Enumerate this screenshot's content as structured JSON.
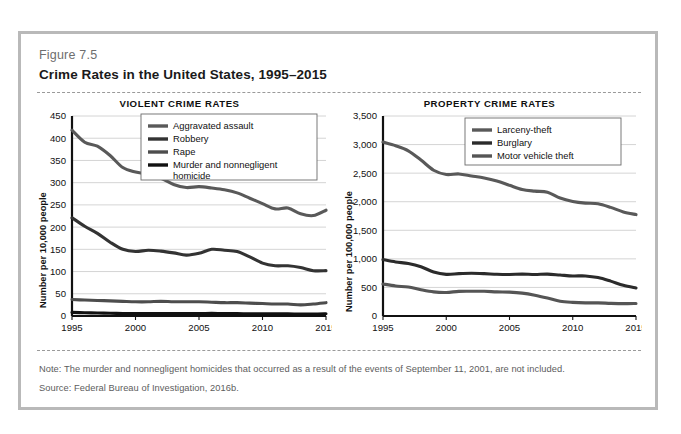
{
  "figure": {
    "number": "Figure 7.5",
    "title": "Crime Rates in the United States, 1995–2015",
    "note": "Note: The murder and nonnegligent homicides that occurred as a result of the events of September 11, 2001, are not included.",
    "source": "Source: Federal Bureau of Investigation, 2016b.",
    "border_color": "#b9b9b9"
  },
  "chart_data": [
    {
      "type": "line",
      "title": "VIOLENT CRIME RATES",
      "xlabel": "",
      "ylabel": "Number per 10,000 people",
      "xlim": [
        1995,
        2015
      ],
      "ylim": [
        0,
        450
      ],
      "yticks": [
        0,
        50,
        100,
        150,
        200,
        250,
        300,
        350,
        400,
        450
      ],
      "ytick_labels": [
        "0",
        "50",
        "100",
        "150",
        "200",
        "250",
        "300",
        "350",
        "400",
        "450"
      ],
      "xticks": [
        1995,
        2000,
        2005,
        2010,
        2015
      ],
      "xtick_labels": [
        "1995",
        "2000",
        "2005",
        "2010",
        "2015"
      ],
      "grid": true,
      "legend_position": "upper-right",
      "x": [
        1995,
        1996,
        1997,
        1998,
        1999,
        2000,
        2001,
        2002,
        2003,
        2004,
        2005,
        2006,
        2007,
        2008,
        2009,
        2010,
        2011,
        2012,
        2013,
        2014,
        2015
      ],
      "series": [
        {
          "name": "Aggravated assault",
          "color": "#595959",
          "values": [
            418,
            391,
            382,
            361,
            334,
            324,
            319,
            310,
            296,
            289,
            291,
            288,
            284,
            277,
            265,
            253,
            241,
            243,
            230,
            226,
            238
          ]
        },
        {
          "name": "Robbery",
          "color": "#333333",
          "values": [
            221,
            202,
            186,
            166,
            150,
            145,
            148,
            146,
            142,
            137,
            141,
            150,
            148,
            145,
            133,
            119,
            113,
            113,
            109,
            102,
            102
          ]
        },
        {
          "name": "Rape",
          "color": "#4d4d4d",
          "values": [
            37,
            36,
            35,
            34,
            33,
            32,
            32,
            33,
            32,
            32,
            32,
            31,
            30,
            30,
            29,
            28,
            27,
            27,
            25,
            27,
            30
          ]
        },
        {
          "name": "Murder and nonnegligent homicide",
          "color": "#111111",
          "values": [
            8.2,
            7.4,
            6.8,
            6.3,
            5.7,
            5.5,
            5.6,
            5.6,
            5.7,
            5.5,
            5.6,
            5.8,
            5.7,
            5.4,
            5.0,
            4.8,
            4.7,
            4.7,
            4.5,
            4.4,
            4.9
          ]
        }
      ]
    },
    {
      "type": "line",
      "title": "PROPERTY CRIME RATES",
      "xlabel": "",
      "ylabel": "Number per 100,000 people",
      "xlim": [
        1995,
        2015
      ],
      "ylim": [
        0,
        3500
      ],
      "yticks": [
        0,
        500,
        1000,
        1500,
        2000,
        2500,
        3000,
        3500
      ],
      "ytick_labels": [
        "0",
        "500",
        "1,000",
        "1,500",
        "2,000",
        "2,500",
        "3,000",
        "3,500"
      ],
      "xticks": [
        1995,
        2000,
        2005,
        2010,
        2015
      ],
      "xtick_labels": [
        "1995",
        "2000",
        "2005",
        "2010",
        "2015"
      ],
      "grid": true,
      "legend_position": "upper-right",
      "x": [
        1995,
        1996,
        1997,
        1998,
        1999,
        2000,
        2001,
        2002,
        2003,
        2004,
        2005,
        2006,
        2007,
        2008,
        2009,
        2010,
        2011,
        2012,
        2013,
        2014,
        2015
      ],
      "series": [
        {
          "name": "Larceny-theft",
          "color": "#595959",
          "values": [
            3043,
            2980,
            2891,
            2729,
            2551,
            2477,
            2486,
            2451,
            2415,
            2362,
            2287,
            2213,
            2185,
            2167,
            2064,
            2005,
            1976,
            1965,
            1901,
            1821,
            1775
          ]
        },
        {
          "name": "Burglary",
          "color": "#2b2b2b",
          "values": [
            987,
            945,
            919,
            863,
            770,
            729,
            741,
            747,
            741,
            730,
            727,
            733,
            726,
            733,
            717,
            701,
            701,
            672,
            610,
            537,
            491
          ]
        },
        {
          "name": "Motor vehicle theft",
          "color": "#555555",
          "values": [
            560,
            526,
            506,
            459,
            422,
            412,
            431,
            433,
            433,
            422,
            417,
            400,
            364,
            315,
            259,
            239,
            230,
            230,
            221,
            216,
            220
          ]
        }
      ]
    }
  ]
}
